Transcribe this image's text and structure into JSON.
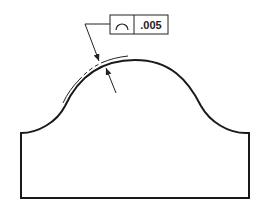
{
  "figure": {
    "type": "gdt-profile-of-a-line-callout",
    "part_outline_color": "#1a1a1a",
    "annotation_color": "#222222",
    "background": "#ffffff"
  },
  "feature_control_frame": {
    "symbol": "profile-of-a-line",
    "tolerance": ".005"
  },
  "tolerance_zone": {
    "style": "phantom-offset-line",
    "description": "offset boundary along the arched profile"
  },
  "leaders": [
    {
      "name": "outer-leader-arrow",
      "direction": "inward"
    },
    {
      "name": "inner-leader-arrow",
      "direction": "outward"
    }
  ]
}
